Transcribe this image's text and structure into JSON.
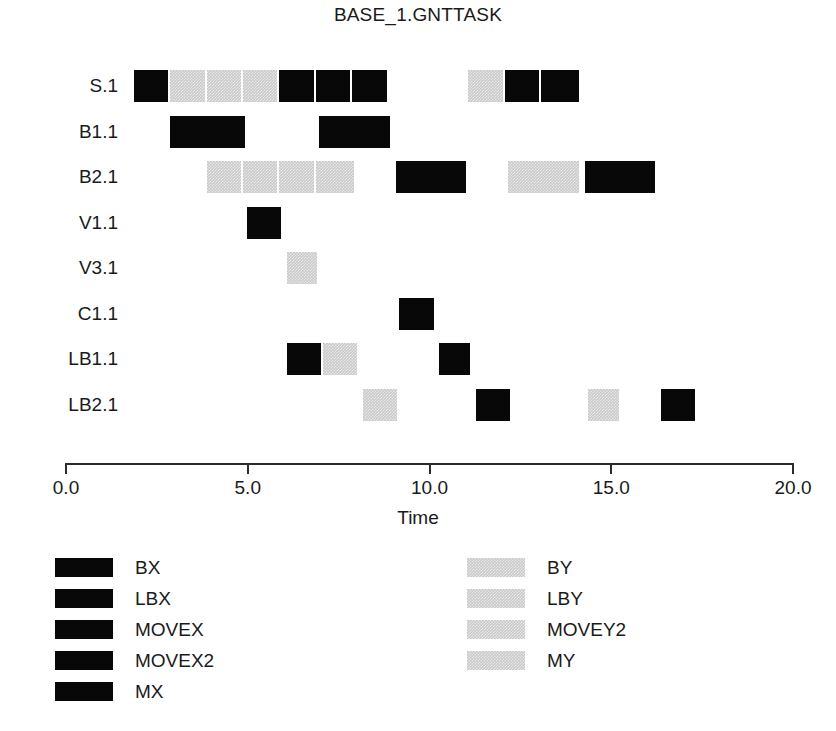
{
  "chart": {
    "title": "BASE_1.GNTTASK",
    "axis_title": "Time"
  },
  "chart_data": {
    "type": "bar",
    "title": "BASE_1.GNTTASK",
    "xlabel": "Time",
    "ylabel": "",
    "xlim": [
      0.0,
      20.0
    ],
    "xticks": [
      "0.0",
      "5.0",
      "10.0",
      "15.0",
      "20.0"
    ],
    "xtick_values": [
      0,
      5,
      10,
      15,
      20
    ],
    "grid": false,
    "legend_position": "bottom",
    "colors": {
      "x_series": "#080808",
      "y_series": "#c9c9c9"
    },
    "categories": [
      "S.1",
      "B1.1",
      "B2.1",
      "V1.1",
      "V3.1",
      "C1.1",
      "LB1.1",
      "LB2.1"
    ],
    "rows": [
      {
        "label": "S.1",
        "bars": [
          {
            "start": 1.9,
            "end": 2.9,
            "color": "x"
          },
          {
            "start": 2.9,
            "end": 3.9,
            "color": "y"
          },
          {
            "start": 3.9,
            "end": 4.9,
            "color": "y"
          },
          {
            "start": 4.9,
            "end": 5.9,
            "color": "y"
          },
          {
            "start": 5.9,
            "end": 6.9,
            "color": "x"
          },
          {
            "start": 6.9,
            "end": 7.9,
            "color": "x"
          },
          {
            "start": 7.9,
            "end": 8.9,
            "color": "x"
          },
          {
            "start": 11.1,
            "end": 12.1,
            "color": "y"
          },
          {
            "start": 12.1,
            "end": 13.1,
            "color": "x"
          },
          {
            "start": 13.1,
            "end": 14.2,
            "color": "x"
          }
        ]
      },
      {
        "label": "B1.1",
        "bars": [
          {
            "start": 2.9,
            "end": 5.0,
            "color": "x"
          },
          {
            "start": 7.0,
            "end": 9.0,
            "color": "x"
          }
        ]
      },
      {
        "label": "B2.1",
        "bars": [
          {
            "start": 3.9,
            "end": 4.9,
            "color": "y"
          },
          {
            "start": 4.9,
            "end": 5.9,
            "color": "y"
          },
          {
            "start": 5.9,
            "end": 6.9,
            "color": "y"
          },
          {
            "start": 6.9,
            "end": 8.0,
            "color": "y"
          },
          {
            "start": 9.1,
            "end": 11.1,
            "color": "x"
          },
          {
            "start": 12.2,
            "end": 14.2,
            "color": "y"
          },
          {
            "start": 14.3,
            "end": 16.3,
            "color": "x"
          }
        ]
      },
      {
        "label": "V1.1",
        "bars": [
          {
            "start": 5.0,
            "end": 6.0,
            "color": "x"
          }
        ]
      },
      {
        "label": "V3.1",
        "bars": [
          {
            "start": 6.1,
            "end": 7.0,
            "color": "y"
          }
        ]
      },
      {
        "label": "C1.1",
        "bars": [
          {
            "start": 9.2,
            "end": 10.2,
            "color": "x"
          }
        ]
      },
      {
        "label": "LB1.1",
        "bars": [
          {
            "start": 6.1,
            "end": 7.1,
            "color": "x"
          },
          {
            "start": 7.1,
            "end": 8.1,
            "color": "y"
          },
          {
            "start": 10.3,
            "end": 11.2,
            "color": "x"
          }
        ]
      },
      {
        "label": "LB2.1",
        "bars": [
          {
            "start": 8.2,
            "end": 9.2,
            "color": "y"
          },
          {
            "start": 11.3,
            "end": 12.3,
            "color": "x"
          },
          {
            "start": 14.4,
            "end": 15.3,
            "color": "y"
          },
          {
            "start": 16.4,
            "end": 17.4,
            "color": "x"
          }
        ]
      }
    ],
    "legend": {
      "left_column": [
        {
          "label": "BX",
          "color": "x"
        },
        {
          "label": "LBX",
          "color": "x"
        },
        {
          "label": "MOVEX",
          "color": "x"
        },
        {
          "label": "MOVEX2",
          "color": "x"
        },
        {
          "label": "MX",
          "color": "x"
        }
      ],
      "right_column": [
        {
          "label": "BY",
          "color": "y"
        },
        {
          "label": "LBY",
          "color": "y"
        },
        {
          "label": "MOVEY2",
          "color": "y"
        },
        {
          "label": "MY",
          "color": "y"
        }
      ]
    }
  }
}
